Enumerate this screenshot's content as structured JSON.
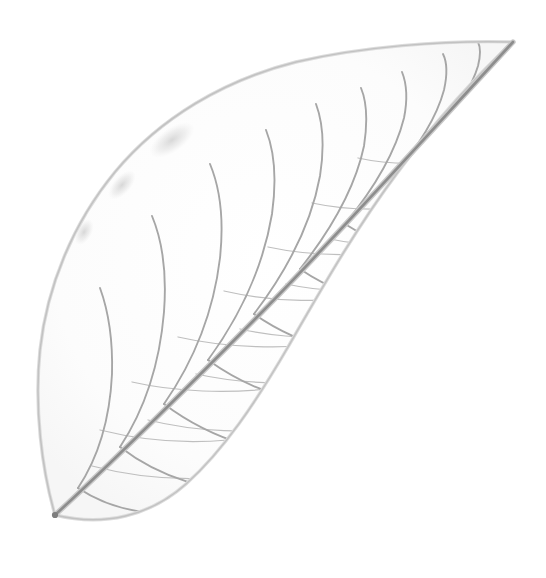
{
  "image": {
    "subject": "leaf-skeleton",
    "caption": "Skeletonized leaf specimen on plain white background",
    "alt_text": "A pressed, skeletonized leaf showing its translucent network of veins and polygonal areoles, with a prominent diagonal midrib running from the lower-left petiole to the upper-right acuminate tip.",
    "width": 546,
    "height": 578,
    "background_color": "#ffffff",
    "orientation": "tip-upper-right"
  },
  "palette": {
    "background": "#ffffff",
    "midrib": "#8d8d8d",
    "midrib_dark": "#7b7b7b",
    "secondary_vein": "#a9a9a9",
    "tertiary_vein": "#bdbdbd",
    "areole_vein": "#cfcfcf",
    "margin_outline": "#c4c4c4",
    "margin_shadow": "#d9d9d9",
    "blotch": "#cacaca"
  },
  "geometry": {
    "tip": [
      513,
      42
    ],
    "base": [
      55,
      515
    ],
    "leftmost": [
      38,
      352
    ],
    "rightmost": [
      466,
      300
    ],
    "midrib_angle_deg": -46,
    "outline_path": "M 55 515 C 42 470 34 408 40 350 C 47 286 73 223 115 172 C 160 118 224 80 296 62 C 360 47 443 40 513 42 C 480 72 436 120 398 172 C 356 228 322 288 288 347 C 256 402 224 450 186 484 C 150 516 104 527 55 515 Z"
  },
  "structure": {
    "midrib_label": "midrib",
    "secondary_vein_label": "secondary vein",
    "areole_label": "areole network",
    "margin_label": "leaf margin",
    "petiole_label": "petiole base",
    "secondary_vein_count_upper": 8,
    "secondary_vein_count_lower": 7
  },
  "veins": {
    "midrib": "M 55 515 C 120 455 190 385 262 312 C 334 239 412 152 513 42",
    "upper": [
      "M 78 488 C 100 455 110 416 112 374 C 113 338 108 310 100 288",
      "M 120 447 C 147 406 160 360 164 312 C 167 272 162 240 152 216",
      "M 164 404 C 196 358 214 308 220 258 C 224 220 220 188 210 164",
      "M 208 360 C 243 312 264 262 272 214 C 277 178 274 150 266 130",
      "M 254 314 C 289 268 312 220 320 176 C 325 144 322 120 316 104",
      "M 300 269 C 334 226 356 184 364 146 C 368 120 366 100 361 88",
      "M 345 224 C 376 186 396 150 404 118 C 408 98 406 82 402 72",
      "M 392 177 C 419 146 437 116 444 90 C 448 72 446 60 443 54",
      "M 437 131 C 458 108 472 86 478 66 C 481 54 480 46 478 42"
    ],
    "lower": [
      "M 78 488 C 108 508 146 516 186 513 C 218 510 242 502 258 493",
      "M 120 447 C 160 478 212 494 266 492 C 310 490 344 480 366 468",
      "M 164 404 C 212 440 274 460 338 455 C 388 451 427 436 450 419",
      "M 208 360 C 258 396 322 414 382 404 C 428 396 455 378 466 360",
      "M 254 314 C 303 348 362 362 412 348 C 448 338 464 320 468 304",
      "M 300 269 C 345 300 396 308 434 292 C 458 281 468 265 470 252",
      "M 345 224 C 384 250 424 254 450 240 C 466 231 472 219 473 208",
      "M 392 177 C 420 196 446 198 462 188 C 472 181 476 172 476 164"
    ],
    "tertiary": [
      "M 100 430 C 140 440 186 444 228 440",
      "M 132 382 C 176 392 228 394 276 388",
      "M 178 337 C 226 348 286 350 338 342",
      "M 224 291 C 272 302 330 304 380 294",
      "M 268 247 C 314 257 368 257 412 247",
      "M 312 203 C 354 212 402 211 440 201",
      "M 358 158 C 394 166 434 165 464 156",
      "M 92 466 C 130 476 172 480 210 478",
      "M 148 420 C 196 432 252 434 300 427",
      "M 196 374 C 246 385 306 386 356 377",
      "M 240 329 C 290 340 348 340 396 330",
      "M 286 284 C 332 294 386 293 428 283",
      "M 330 239 C 372 248 418 246 452 237"
    ]
  },
  "accessibility": {
    "role": "img",
    "described_as": "Botanical specimen photograph"
  }
}
